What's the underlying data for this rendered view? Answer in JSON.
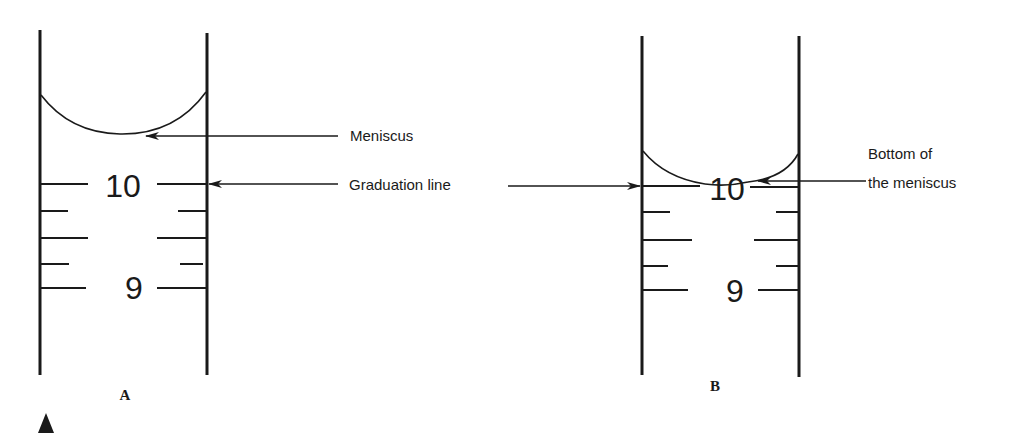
{
  "diagram": {
    "panels": [
      {
        "id": "A",
        "label": "A",
        "numbers": {
          "upper": "10",
          "lower": "9"
        }
      },
      {
        "id": "B",
        "label": "B",
        "numbers": {
          "upper": "10",
          "lower": "9"
        }
      }
    ],
    "annotations": {
      "meniscus": "Meniscus",
      "graduation_line": "Graduation line",
      "bottom_of_meniscus_line1": "Bottom of",
      "bottom_of_meniscus_line2": "the meniscus"
    },
    "colors": {
      "ink": "#1a1a1a",
      "background": "#ffffff"
    }
  }
}
